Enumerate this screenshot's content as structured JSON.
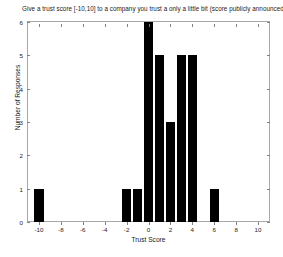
{
  "chart_data": {
    "type": "bar",
    "title": "Give a trust score [-10,10] to a company you trust a only a little bit  (score publicly announced)",
    "xlabel": "Trust Score",
    "ylabel": "Number of Responses",
    "xlim": [
      -11,
      11
    ],
    "ylim": [
      0,
      6
    ],
    "xticks": [
      -10,
      -8,
      -6,
      -4,
      -2,
      0,
      2,
      4,
      6,
      8,
      10
    ],
    "xticklabels": [
      "-10",
      "-8",
      "-6",
      "-4",
      "-2",
      "0",
      "2",
      "4",
      "6",
      "8",
      "10"
    ],
    "yticks": [
      0,
      1,
      2,
      3,
      4,
      5,
      6
    ],
    "yticklabels": [
      "0",
      "1",
      "2",
      "3",
      "4",
      "5",
      "6"
    ],
    "grid": false,
    "legend": null,
    "bar_color": "#000000",
    "categories": [
      -10,
      -2,
      -1,
      0,
      1,
      2,
      3,
      4,
      6
    ],
    "values": [
      1,
      1,
      1,
      6,
      5,
      3,
      5,
      5,
      1
    ],
    "bars": [
      {
        "x": -10,
        "height": 1
      },
      {
        "x": -2,
        "height": 1
      },
      {
        "x": -1,
        "height": 1
      },
      {
        "x": 0,
        "height": 6
      },
      {
        "x": 1,
        "height": 5
      },
      {
        "x": 2,
        "height": 3
      },
      {
        "x": 3,
        "height": 5
      },
      {
        "x": 4,
        "height": 5
      },
      {
        "x": 6,
        "height": 1
      }
    ]
  }
}
